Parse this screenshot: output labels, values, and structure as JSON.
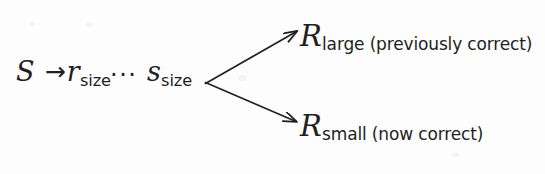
{
  "figure": {
    "background_color": "#fdfdfd",
    "ink_color": "#231f20"
  },
  "production": {
    "start_symbol": "S",
    "arrow": "→",
    "first_nonterminal": {
      "base": "r",
      "subscript": "size"
    },
    "ellipsis": "···",
    "second_nonterminal": {
      "base": "s",
      "subscript": "size"
    }
  },
  "branches": [
    {
      "id": "large",
      "base": "R",
      "subscript": "large",
      "annotation": "(previously correct)",
      "tail": "large (previously correct)",
      "direction": "up"
    },
    {
      "id": "small",
      "base": "R",
      "subscript": "small",
      "annotation": "(now correct)",
      "tail": "small (now correct)",
      "direction": "down"
    }
  ],
  "arrows": {
    "production_arrow_label": "rewrites-to-arrow",
    "branch_upper_label": "branch-arrow-large",
    "branch_lower_label": "branch-arrow-small"
  }
}
